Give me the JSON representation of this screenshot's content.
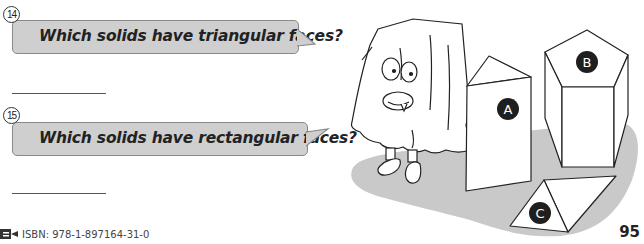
{
  "questions": [
    {
      "number": "14",
      "text": "Which solids have triangular faces?",
      "answer": ""
    },
    {
      "number": "15",
      "text": "Which solids have rectangular faces?",
      "answer": ""
    }
  ],
  "illustration": {
    "character": "ghost-in-sheet",
    "solids": [
      {
        "label": "A",
        "shape": "triangular prism (standing)"
      },
      {
        "label": "B",
        "shape": "pentagonal prism"
      },
      {
        "label": "C",
        "shape": "triangular prism (lying)"
      }
    ]
  },
  "footer": {
    "isbn": "ISBN: 978-1-897164-31-0",
    "page_number": "95"
  },
  "colors": {
    "bubble_fill": "#cfcfcf",
    "bubble_border": "#8a8a8a",
    "shadow": "#c9c9c9",
    "label_circle": "#1f1f1f"
  }
}
